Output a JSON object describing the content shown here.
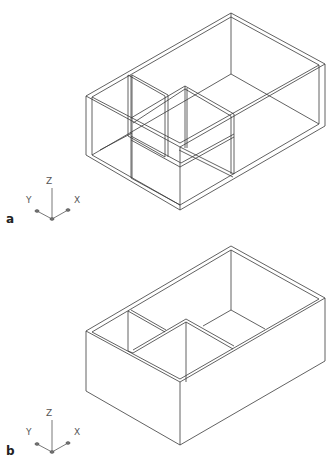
{
  "figures": [
    {
      "id": "a",
      "label": "a",
      "description": "Wireframe isometric view of box with internal partitions (visual style: wireframe)",
      "axis_icon": {
        "x": "X",
        "y": "Y",
        "z": "Z"
      }
    },
    {
      "id": "b",
      "label": "b",
      "description": "Hidden-line isometric view of open box with internal partitions",
      "axis_icon": {
        "x": "X",
        "y": "Y",
        "z": "Z"
      }
    }
  ],
  "colors": {
    "line": "#3a3a3a",
    "background": "#ffffff"
  }
}
